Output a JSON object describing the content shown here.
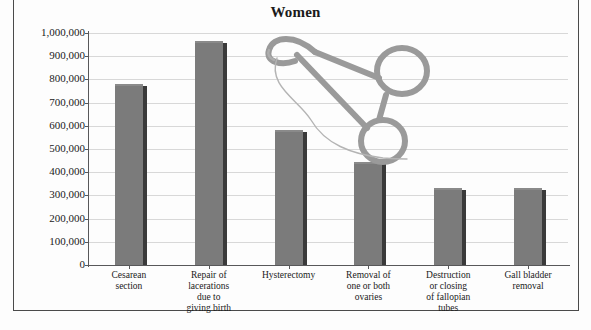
{
  "chart_title": "Women",
  "chart_data": {
    "type": "bar",
    "title": "Women",
    "xlabel": "",
    "ylabel": "",
    "ylim": [
      0,
      1000000
    ],
    "grid": true,
    "legend": "none",
    "categories": [
      "Cesarean section",
      "Repair of lacerations due to giving birth",
      "Hysterectomy",
      "Removal of one or both ovaries",
      "Destruction or closing of fallopian tubes",
      "Gall bladder removal"
    ],
    "category_lines": [
      [
        "Cesarean",
        "section"
      ],
      [
        "Repair of",
        "lacerations",
        "due to",
        "giving birth"
      ],
      [
        "Hysterectomy"
      ],
      [
        "Removal of",
        "one or both",
        "ovaries"
      ],
      [
        "Destruction",
        "or closing",
        "of fallopian",
        "tubes"
      ],
      [
        "Gall bladder",
        "removal"
      ]
    ],
    "values": [
      780000,
      965000,
      580000,
      445000,
      332000,
      332000
    ],
    "ytick_labels": [
      "1,000,000",
      "900,000",
      "800,000",
      "700,000",
      "600,000",
      "500,000",
      "400,000",
      "300,000",
      "200,000",
      "100,000",
      "0"
    ],
    "ytick_values": [
      1000000,
      900000,
      800000,
      700000,
      600000,
      500000,
      400000,
      300000,
      200000,
      100000,
      0
    ],
    "bar_color": "#7b7b7b",
    "bar_shadow_color": "#3a3a3a",
    "gridline_color": "#d8d8d8",
    "axis_color": "#58585a",
    "background_color": "#fdfdfd",
    "text_color": "#1a1a1a"
  },
  "illustration": {
    "name": "surgical-clamp-hemostat-with-suture-thread",
    "stroke_color": "#9a9a9a",
    "thread_color": "#b0b0b0"
  }
}
